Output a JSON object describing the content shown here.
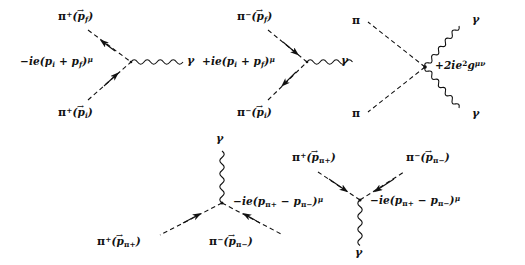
{
  "figure": {
    "background": "#ffffff",
    "ink": "#111111",
    "line_styles": {
      "pion": "dashed",
      "photon": "wavy"
    }
  },
  "diagrams": [
    {
      "id": "pi-plus-emission",
      "name": "pi-plus-photon-vertex",
      "vertex_label": "−ie(pᵢ + p_f)ᵐ",
      "vertex_label_parts": {
        "prefix": "−ie(p",
        "sub1": "i",
        "mid": " + p",
        "sub2": "f",
        "suffix": ")",
        "sup": "μ"
      },
      "legs": [
        {
          "role": "outgoing-pion",
          "particle": "π",
          "charge": "+",
          "momentum": "p",
          "momentum_sub": "f",
          "arrow": "toward-vertex"
        },
        {
          "role": "incoming-pion",
          "particle": "π",
          "charge": "+",
          "momentum": "p",
          "momentum_sub": "i",
          "arrow": "toward-vertex"
        },
        {
          "role": "photon",
          "particle": "γ",
          "charge": "",
          "momentum": "",
          "momentum_sub": "",
          "arrow": "none"
        }
      ],
      "labels": {
        "top": {
          "particle": "π",
          "charge": "+",
          "momentum": "p",
          "momentum_sub": "f"
        },
        "bottom": {
          "particle": "π",
          "charge": "+",
          "momentum": "p",
          "momentum_sub": "i"
        },
        "photon": "γ"
      }
    },
    {
      "id": "pi-minus-emission",
      "name": "pi-minus-photon-vertex",
      "vertex_label": "+ie(pᵢ + p_f)ᵐ",
      "vertex_label_parts": {
        "prefix": "+ie(p",
        "sub1": "i",
        "mid": " + p",
        "sub2": "f",
        "suffix": ")",
        "sup": "μ"
      },
      "legs": [
        {
          "role": "outgoing-pion",
          "particle": "π",
          "charge": "−",
          "momentum": "p",
          "momentum_sub": "f",
          "arrow": "away-from-vertex"
        },
        {
          "role": "incoming-pion",
          "particle": "π",
          "charge": "−",
          "momentum": "p",
          "momentum_sub": "i",
          "arrow": "away-from-vertex"
        },
        {
          "role": "photon",
          "particle": "γ",
          "charge": "",
          "momentum": "",
          "momentum_sub": "",
          "arrow": "none"
        }
      ],
      "labels": {
        "top": {
          "particle": "π",
          "charge": "−",
          "momentum": "p",
          "momentum_sub": "f"
        },
        "bottom": {
          "particle": "π",
          "charge": "−",
          "momentum": "p",
          "momentum_sub": "i"
        },
        "photon": "γ"
      }
    },
    {
      "id": "seagull",
      "name": "seagull-four-point-vertex",
      "vertex_label": "+2ie²gᵐᵛ",
      "vertex_label_parts": {
        "prefix": "+2ie",
        "sup1": "2",
        "mid": "g",
        "sup2": "μν"
      },
      "labels": {
        "pion_top": "π",
        "pion_bottom": "π",
        "photon_top": "γ",
        "photon_bottom": "γ"
      }
    },
    {
      "id": "pair-annihilation-up",
      "name": "pion-pair-photon-vertex-up",
      "vertex_label": "−ie(p_π+ − p_π−)ᵐ",
      "vertex_label_parts": {
        "prefix": "−ie(p",
        "sub1": "π+",
        "mid": " − p",
        "sub2": "π−",
        "suffix": ")",
        "sup": "μ"
      },
      "labels": {
        "photon": "γ",
        "left": {
          "particle": "π",
          "charge": "+",
          "momentum": "p",
          "momentum_sub": "π+"
        },
        "right": {
          "particle": "π",
          "charge": "−",
          "momentum": "p",
          "momentum_sub": "π−"
        }
      }
    },
    {
      "id": "pair-annihilation-down",
      "name": "pion-pair-photon-vertex-down",
      "vertex_label": "−ie(p_π+ − p_π−)ᵐ",
      "vertex_label_parts": {
        "prefix": "−ie(p",
        "sub1": "π+",
        "mid": " − p",
        "sub2": "π−",
        "suffix": ")",
        "sup": "μ"
      },
      "labels": {
        "photon": "γ",
        "left": {
          "particle": "π",
          "charge": "+",
          "momentum": "p",
          "momentum_sub": "π+"
        },
        "right": {
          "particle": "π",
          "charge": "−",
          "momentum": "p",
          "momentum_sub": "π−"
        }
      }
    }
  ]
}
